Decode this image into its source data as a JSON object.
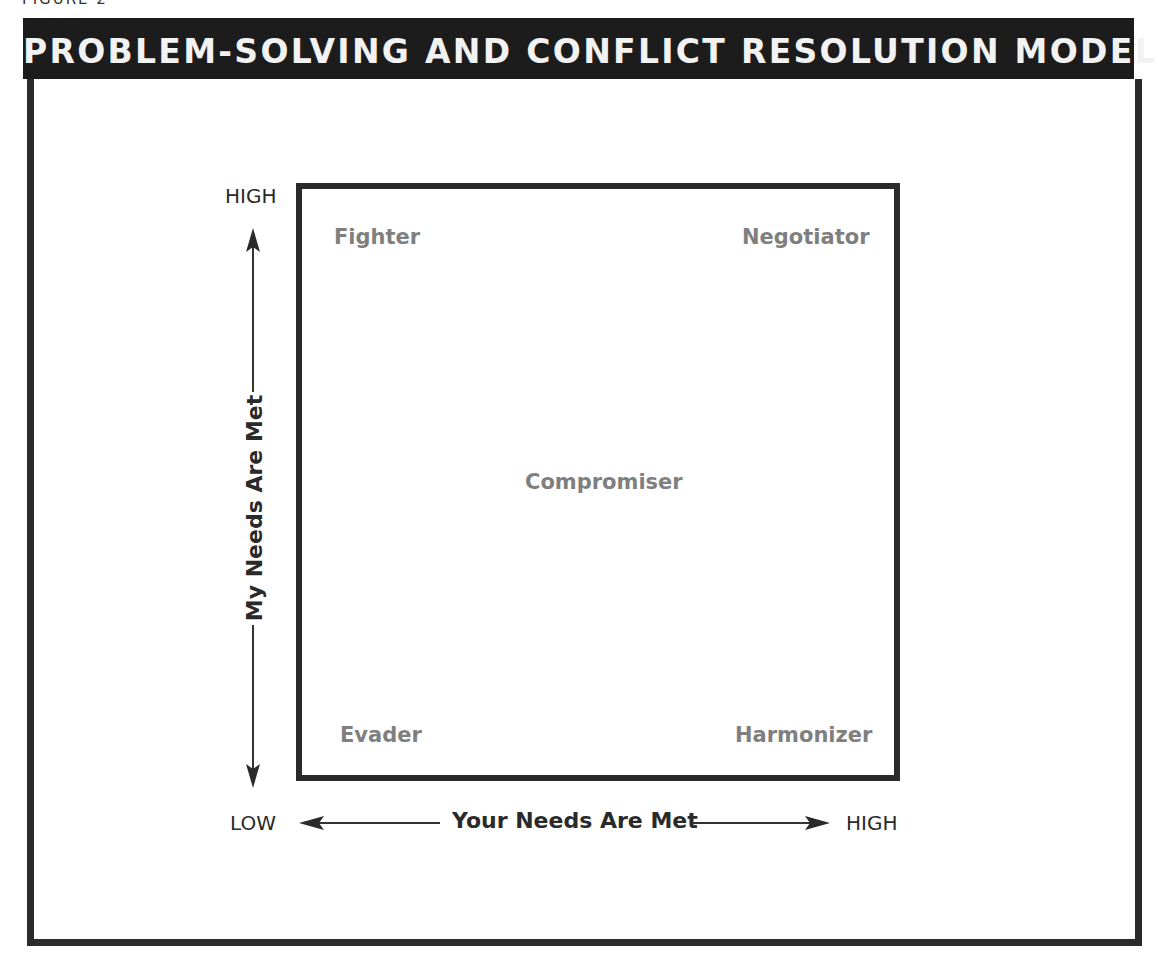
{
  "figure": {
    "label": "FIGURE 2",
    "title": "PROBLEM-SOLVING AND CONFLICT RESOLUTION MODEL"
  },
  "diagram": {
    "type": "2x2 quadrant model",
    "quadrants": {
      "top_left": "Fighter",
      "top_right": "Negotiator",
      "center": "Compromiser",
      "bottom_left": "Evader",
      "bottom_right": "Harmonizer"
    },
    "y_axis": {
      "label": "My Needs Are Met",
      "high": "HIGH",
      "low": "LOW"
    },
    "x_axis": {
      "label": "Your Needs Are Met",
      "low": "LOW",
      "high": "HIGH"
    },
    "colors": {
      "title_bar": "#1c1c1c",
      "title_text": "#f2f2f2",
      "border": "#2b2b2b",
      "quadrant_text": "#7f7f7f",
      "axis_text": "#2a2a2a"
    }
  }
}
